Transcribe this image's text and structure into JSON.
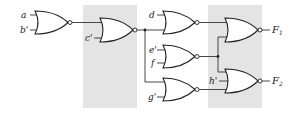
{
  "diagram": {
    "type": "logic-circuit",
    "gate_type": "NOR",
    "inputs": [
      "a",
      "b'",
      "c'",
      "d",
      "e'",
      "f",
      "g'",
      "h'"
    ],
    "outputs": [
      {
        "label": "F",
        "sub": "1"
      },
      {
        "label": "F",
        "sub": "2"
      }
    ],
    "labels": {
      "a": "a",
      "b": "b'",
      "c": "c'",
      "d": "d",
      "e": "e'",
      "f": "f",
      "g": "g'",
      "h": "h'",
      "F1": "F",
      "F1_sub": "1",
      "F2": "F",
      "F2_sub": "2"
    },
    "shaded_regions": 2,
    "colors": {
      "shade": "#e4e4e4",
      "line": "#222222"
    }
  }
}
